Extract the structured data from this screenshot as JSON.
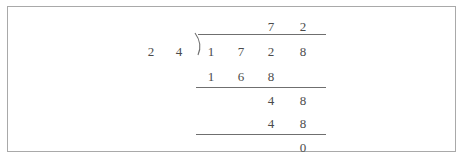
{
  "figure": {
    "type": "long-division",
    "border_color": "#a9a9a9",
    "ink_color": "#4b4b4b",
    "rule_color": "#6f6f6f",
    "background": "#ffffff"
  },
  "problem": {
    "divisor": 24,
    "dividend": 1728,
    "quotient": 72,
    "remainder": 0,
    "expression": "1728 / 24 = 72"
  },
  "divisor_digits": [
    "2",
    "4"
  ],
  "quotient_digits": [
    "7",
    "2"
  ],
  "dividend_digits": [
    "1",
    "7",
    "2",
    "8"
  ],
  "subtract_step_1": [
    "1",
    "6",
    "8"
  ],
  "remainder_step_1": [
    "4",
    "8"
  ],
  "subtract_step_2": [
    "4",
    "8"
  ],
  "final_remainder": "0",
  "bracket": {
    "glyph": "division-bracket"
  }
}
